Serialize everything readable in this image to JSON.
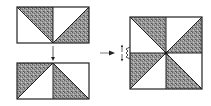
{
  "diagram": {
    "title": "",
    "colors": {
      "outline": "#222222",
      "shaded_fill": "#8e8e8e",
      "shaded_texture": "#5a5a5a",
      "background": "#ffffff",
      "unshaded_fill": "#ffffff"
    },
    "steps": [
      {
        "id": "pair-top",
        "label": "",
        "units": [
          {
            "position": "left",
            "diagonal": "top-left-to-bottom-right",
            "shaded": "upper-right"
          },
          {
            "position": "right",
            "diagonal": "bottom-left-to-top-right",
            "shaded": "lower-right"
          }
        ]
      },
      {
        "id": "pair-bottom",
        "label": "",
        "units": [
          {
            "position": "left",
            "diagonal": "bottom-left-to-top-right",
            "shaded": "upper-left"
          },
          {
            "position": "right",
            "diagonal": "top-left-to-bottom-right",
            "shaded": "lower-left"
          }
        ]
      },
      {
        "id": "pinwheel-block",
        "label": "",
        "units": 8,
        "note": "Seam allowances pressed in opposite directions at center seam"
      }
    ],
    "arrows": [
      {
        "id": "arrow-down",
        "direction": "down",
        "from": "pair-top",
        "to": "pair-bottom"
      },
      {
        "id": "arrow-right",
        "direction": "right",
        "from": "pairs",
        "to": "pinwheel-block"
      },
      {
        "id": "seam-press-up",
        "direction": "up"
      },
      {
        "id": "seam-press-down",
        "direction": "down"
      }
    ]
  }
}
